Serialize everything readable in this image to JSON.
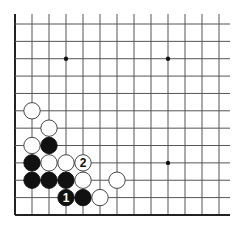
{
  "diagram": {
    "type": "go-board-fragment",
    "grid": {
      "columns": 13,
      "rows": 12,
      "origin_x": 15,
      "origin_y": 24,
      "spacing_x": 17.0,
      "spacing_y": 17.36,
      "top_line_start": 14,
      "right_extent": 230,
      "left_edge_thick": true,
      "bottom_edge_thick": true,
      "line_color": "#555555",
      "edge_color": "#222222"
    },
    "star_points": [
      {
        "col": 3,
        "row": 2
      },
      {
        "col": 9,
        "row": 2
      },
      {
        "col": 9,
        "row": 8
      }
    ],
    "stones": [
      {
        "color": "white",
        "col": 1,
        "row": 5,
        "label": ""
      },
      {
        "color": "white",
        "col": 2,
        "row": 6,
        "label": ""
      },
      {
        "color": "white",
        "col": 1,
        "row": 7,
        "label": ""
      },
      {
        "color": "black",
        "col": 2,
        "row": 7,
        "label": ""
      },
      {
        "color": "black",
        "col": 1,
        "row": 8,
        "label": ""
      },
      {
        "color": "white",
        "col": 2,
        "row": 8,
        "label": ""
      },
      {
        "color": "white",
        "col": 3,
        "row": 8,
        "label": ""
      },
      {
        "color": "white",
        "col": 4,
        "row": 8,
        "label": "2"
      },
      {
        "color": "black",
        "col": 1,
        "row": 9,
        "label": ""
      },
      {
        "color": "black",
        "col": 2,
        "row": 9,
        "label": ""
      },
      {
        "color": "black",
        "col": 3,
        "row": 9,
        "label": ""
      },
      {
        "color": "white",
        "col": 4,
        "row": 9,
        "label": ""
      },
      {
        "color": "white",
        "col": 6,
        "row": 9,
        "label": ""
      },
      {
        "color": "black",
        "col": 3,
        "row": 10,
        "label": "1"
      },
      {
        "color": "black",
        "col": 4,
        "row": 10,
        "label": ""
      },
      {
        "color": "white",
        "col": 5,
        "row": 10,
        "label": ""
      }
    ],
    "colors": {
      "black_stone": "#111111",
      "white_stone": "#ffffff",
      "white_stone_border": "#333333",
      "background": "#ffffff"
    }
  }
}
